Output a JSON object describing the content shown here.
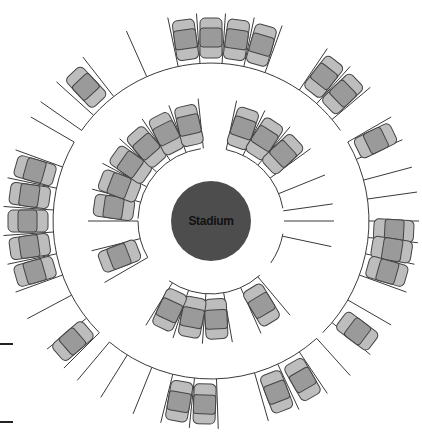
{
  "stadium": {
    "label": "Stadium",
    "fill": "#4d4d4d",
    "label_color": "#111111"
  },
  "colors": {
    "line": "#3a3a3a",
    "car_body": "#bdbdbd",
    "car_cabin": "#9a9a9a",
    "car_outline": "#444444"
  },
  "geometry": {
    "center": [
      211,
      221
    ],
    "stadium_radius": 40,
    "inner_ring_radius": 73,
    "outer_ring_radius": 158,
    "stall_depth_inner": 50,
    "stall_depth_outer": 50
  },
  "inner_ring": {
    "arcs": [
      {
        "name": "upper-left-arc",
        "from": 182,
        "to": 262
      },
      {
        "name": "upper-right-arc",
        "from": 282,
        "to": 350
      },
      {
        "name": "lower-right-arc",
        "from": 10,
        "to": 35
      },
      {
        "name": "lower-arc",
        "from": 48,
        "to": 125
      },
      {
        "name": "left-arc",
        "from": 150,
        "to": 180
      }
    ],
    "stall_lines": [
      180,
      195,
      208,
      222,
      236,
      250,
      264,
      282,
      296,
      310,
      324,
      338,
      352,
      0,
      12,
      50,
      66,
      80,
      94,
      108,
      122,
      150,
      166
    ],
    "cars": [
      188,
      201,
      215,
      229,
      243,
      257,
      289,
      303,
      317,
      159,
      59,
      87,
      101,
      115
    ]
  },
  "outer_ring": {
    "arcs": [
      {
        "name": "top-arc",
        "from": 215,
        "to": 325
      },
      {
        "name": "right-arc",
        "from": 330,
        "to": 405
      },
      {
        "name": "bottom-arc",
        "from": 48,
        "to": 130
      },
      {
        "name": "left-arc",
        "from": 135,
        "to": 210
      }
    ],
    "stall_lines": [
      215,
      222,
      232,
      246,
      258,
      266,
      274,
      282,
      290,
      304,
      312,
      320,
      330,
      337,
      345,
      352,
      0,
      6,
      12,
      20,
      30,
      40,
      48,
      56,
      65,
      74,
      88,
      96,
      104,
      112,
      122,
      130,
      135,
      142,
      152,
      160,
      168,
      176,
      184,
      192,
      200,
      210
    ],
    "cars": [
      227,
      262,
      270,
      278,
      286,
      308,
      316,
      334,
      3,
      9,
      16,
      37,
      60,
      69,
      92,
      100,
      139,
      164,
      172,
      180,
      188,
      196
    ],
    "reverse_cars": []
  },
  "edge_marks": [
    {
      "top": 343
    },
    {
      "top": 421
    }
  ]
}
